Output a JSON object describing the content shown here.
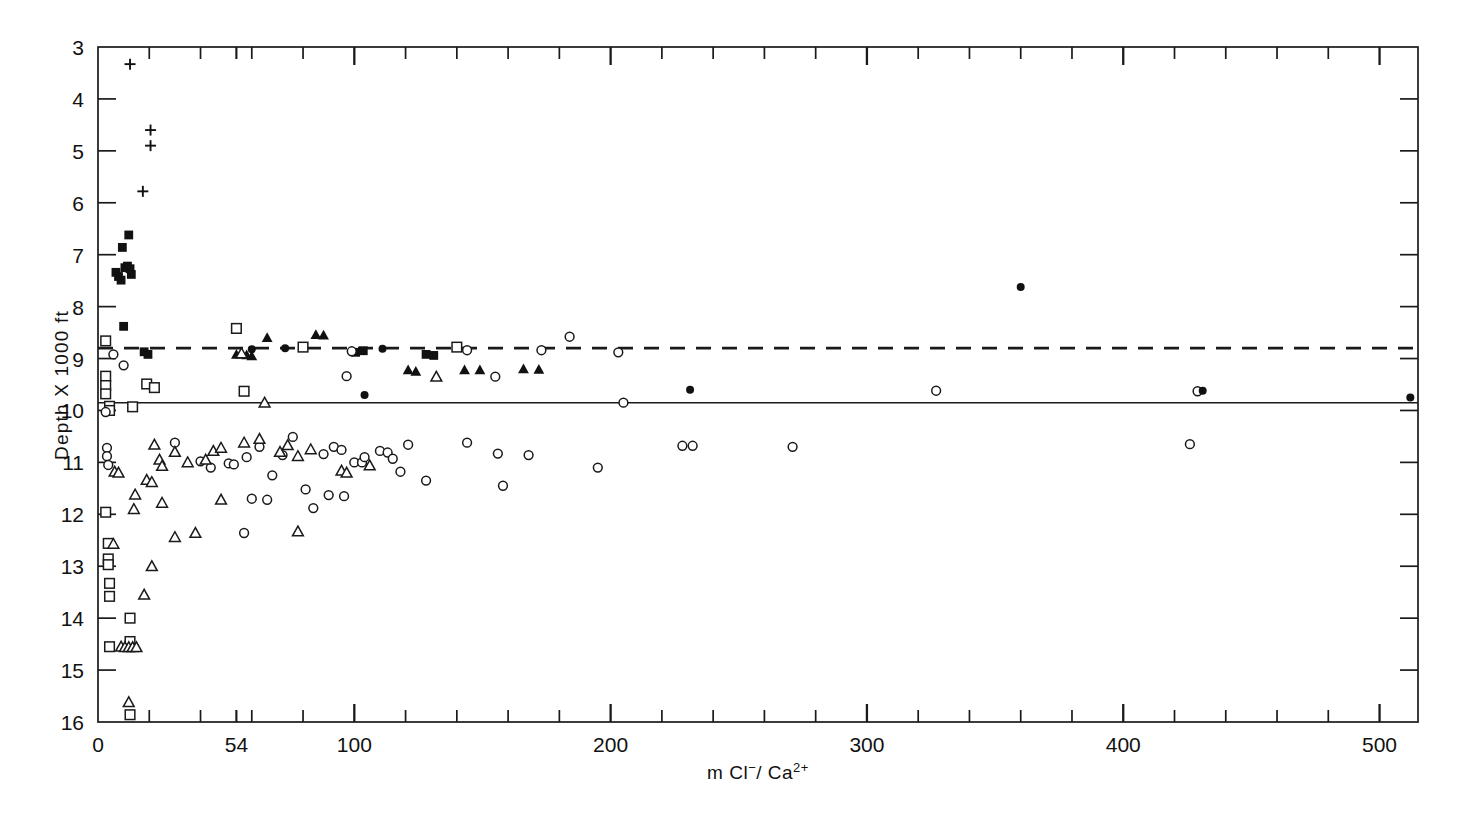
{
  "figure": {
    "background": "#ffffff",
    "ink": "#111111"
  },
  "chart_data": {
    "type": "scatter",
    "title": "",
    "xlabel": "m Cl⁻ / Ca²⁺",
    "ylabel": "Depth X 1000 ft",
    "xlim": [
      0,
      515
    ],
    "ylim": [
      16,
      3
    ],
    "y_inverted": true,
    "grid": false,
    "legend_position": "none",
    "x_tick_labels": [
      "0",
      "54",
      "100",
      "200",
      "300",
      "400",
      "500"
    ],
    "x_tick_values": [
      0,
      54,
      100,
      200,
      300,
      400,
      500
    ],
    "x_minor_step": 20,
    "y_tick_labels": [
      "3",
      "4",
      "5",
      "6",
      "7",
      "8",
      "9",
      "10",
      "11",
      "12",
      "13",
      "14",
      "15",
      "16"
    ],
    "y_tick_values": [
      3,
      4,
      5,
      6,
      7,
      8,
      9,
      10,
      11,
      12,
      13,
      14,
      15,
      16
    ],
    "reference_lines": [
      {
        "name": "dashed-reference-line",
        "style": "dashed",
        "y": 8.8
      },
      {
        "name": "solid-reference-line",
        "style": "solid",
        "y": 9.85
      }
    ],
    "series": [
      {
        "name": "plus",
        "marker": "plus",
        "fill": "none",
        "points": [
          [
            12.5,
            3.33
          ],
          [
            20.5,
            4.6
          ],
          [
            20.5,
            4.9
          ],
          [
            17.5,
            5.78
          ]
        ]
      },
      {
        "name": "filled-square",
        "marker": "square",
        "fill": "solid",
        "points": [
          [
            12.0,
            6.62
          ],
          [
            9.5,
            6.86
          ],
          [
            7.0,
            7.34
          ],
          [
            8.0,
            7.42
          ],
          [
            9.0,
            7.49
          ],
          [
            10.5,
            7.25
          ],
          [
            11.5,
            7.22
          ],
          [
            12.5,
            7.27
          ],
          [
            13.0,
            7.38
          ],
          [
            10.0,
            8.38
          ],
          [
            18.0,
            8.87
          ],
          [
            19.5,
            8.92
          ],
          [
            128.0,
            8.92
          ],
          [
            131.0,
            8.94
          ],
          [
            100.5,
            8.88
          ],
          [
            103.5,
            8.85
          ]
        ]
      },
      {
        "name": "open-square",
        "marker": "square",
        "fill": "open",
        "points": [
          [
            3.0,
            8.66
          ],
          [
            3.0,
            9.34
          ],
          [
            3.0,
            9.52
          ],
          [
            3.0,
            9.68
          ],
          [
            4.5,
            9.92
          ],
          [
            4.5,
            10.0
          ],
          [
            13.5,
            9.93
          ],
          [
            19.0,
            9.49
          ],
          [
            22.0,
            9.56
          ],
          [
            54.0,
            8.42
          ],
          [
            57.0,
            9.63
          ],
          [
            80.0,
            8.78
          ],
          [
            140.0,
            8.78
          ],
          [
            3.0,
            11.96
          ],
          [
            4.0,
            12.56
          ],
          [
            4.0,
            12.86
          ],
          [
            4.0,
            12.97
          ],
          [
            4.5,
            13.33
          ],
          [
            4.5,
            13.58
          ],
          [
            12.5,
            14.0
          ],
          [
            12.5,
            14.45
          ],
          [
            4.5,
            14.55
          ],
          [
            12.5,
            15.86
          ]
        ]
      },
      {
        "name": "open-circle",
        "marker": "circle",
        "fill": "open",
        "points": [
          [
            6.0,
            8.92
          ],
          [
            10.0,
            9.13
          ],
          [
            99.0,
            8.86
          ],
          [
            144.0,
            8.84
          ],
          [
            173.0,
            8.84
          ],
          [
            184.0,
            8.58
          ],
          [
            203.0,
            8.88
          ],
          [
            97.0,
            9.34
          ],
          [
            155.0,
            9.35
          ],
          [
            205.0,
            9.85
          ],
          [
            3.0,
            10.03
          ],
          [
            3.5,
            10.72
          ],
          [
            3.5,
            10.88
          ],
          [
            4.0,
            11.05
          ],
          [
            30.0,
            10.62
          ],
          [
            40.0,
            10.98
          ],
          [
            44.0,
            11.1
          ],
          [
            51.0,
            11.02
          ],
          [
            53.0,
            11.04
          ],
          [
            58.0,
            10.9
          ],
          [
            63.0,
            10.7
          ],
          [
            68.0,
            11.25
          ],
          [
            72.0,
            10.86
          ],
          [
            76.0,
            10.51
          ],
          [
            81.0,
            11.52
          ],
          [
            88.0,
            10.84
          ],
          [
            92.0,
            10.7
          ],
          [
            95.0,
            10.76
          ],
          [
            100.0,
            11.0
          ],
          [
            103.0,
            11.0
          ],
          [
            104.0,
            10.9
          ],
          [
            110.0,
            10.78
          ],
          [
            113.0,
            10.81
          ],
          [
            115.0,
            10.93
          ],
          [
            118.0,
            11.18
          ],
          [
            121.0,
            10.66
          ],
          [
            128.0,
            11.35
          ],
          [
            144.0,
            10.62
          ],
          [
            156.0,
            10.83
          ],
          [
            158.0,
            11.45
          ],
          [
            168.0,
            10.86
          ],
          [
            195.0,
            11.1
          ],
          [
            228.0,
            10.68
          ],
          [
            232.0,
            10.68
          ],
          [
            271.0,
            10.7
          ],
          [
            327.0,
            9.62
          ],
          [
            429.0,
            9.63
          ],
          [
            426.0,
            10.65
          ],
          [
            60.0,
            11.7
          ],
          [
            66.0,
            11.72
          ],
          [
            84.0,
            11.88
          ],
          [
            90.0,
            11.63
          ],
          [
            96.0,
            11.65
          ],
          [
            57.0,
            12.36
          ]
        ]
      },
      {
        "name": "filled-circle",
        "marker": "circle",
        "fill": "solid",
        "points": [
          [
            60.0,
            8.82
          ],
          [
            73.0,
            8.8
          ],
          [
            111.0,
            8.81
          ],
          [
            104.0,
            9.7
          ],
          [
            231.0,
            9.6
          ],
          [
            360.0,
            7.62
          ],
          [
            431.0,
            9.62
          ],
          [
            512.0,
            9.75
          ]
        ]
      },
      {
        "name": "filled-triangle",
        "marker": "triangle",
        "fill": "solid",
        "points": [
          [
            66.0,
            8.6
          ],
          [
            85.0,
            8.54
          ],
          [
            88.0,
            8.55
          ],
          [
            121.0,
            9.22
          ],
          [
            124.0,
            9.25
          ],
          [
            143.0,
            9.22
          ],
          [
            149.0,
            9.22
          ],
          [
            166.0,
            9.2
          ],
          [
            172.0,
            9.21
          ],
          [
            54.0,
            8.92
          ],
          [
            58.0,
            8.93
          ],
          [
            60.0,
            8.95
          ]
        ]
      },
      {
        "name": "open-triangle",
        "marker": "triangle",
        "fill": "open",
        "points": [
          [
            56.0,
            8.9
          ],
          [
            65.0,
            9.85
          ],
          [
            132.0,
            9.35
          ],
          [
            6.5,
            11.18
          ],
          [
            8.0,
            11.2
          ],
          [
            22.0,
            10.66
          ],
          [
            24.0,
            10.95
          ],
          [
            25.0,
            11.07
          ],
          [
            19.0,
            11.34
          ],
          [
            21.0,
            11.38
          ],
          [
            14.5,
            11.62
          ],
          [
            30.0,
            10.8
          ],
          [
            35.0,
            11.0
          ],
          [
            42.0,
            10.95
          ],
          [
            45.0,
            10.78
          ],
          [
            48.0,
            10.72
          ],
          [
            57.0,
            10.62
          ],
          [
            63.0,
            10.55
          ],
          [
            71.0,
            10.8
          ],
          [
            74.0,
            10.67
          ],
          [
            78.0,
            10.88
          ],
          [
            83.0,
            10.75
          ],
          [
            48.0,
            11.72
          ],
          [
            25.0,
            11.78
          ],
          [
            14.0,
            11.9
          ],
          [
            6.0,
            12.57
          ],
          [
            30.0,
            12.44
          ],
          [
            38.0,
            12.36
          ],
          [
            21.0,
            13.0
          ],
          [
            18.0,
            13.55
          ],
          [
            9.0,
            14.55
          ],
          [
            10.5,
            14.56
          ],
          [
            12.0,
            14.56
          ],
          [
            13.5,
            14.56
          ],
          [
            15.0,
            14.56
          ],
          [
            12.0,
            15.62
          ],
          [
            95.0,
            11.16
          ],
          [
            97.0,
            11.2
          ],
          [
            106.0,
            11.06
          ],
          [
            78.0,
            12.33
          ]
        ]
      }
    ]
  },
  "axes": {
    "x_axis_name": "x-axis",
    "y_axis_name": "y-axis"
  }
}
